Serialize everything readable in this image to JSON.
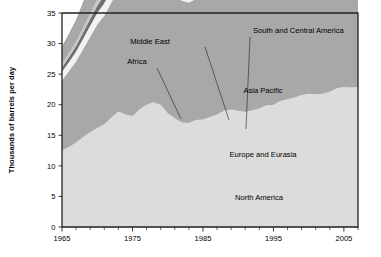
{
  "chart_data": {
    "type": "area",
    "title": "",
    "subtitle": "",
    "xlabel": "",
    "ylabel": "Thousands of barrels per day",
    "xlim": [
      1965,
      2007
    ],
    "ylim": [
      0,
      35
    ],
    "grid": true,
    "stacked": true,
    "legend_position": "inline-annotations",
    "ytick_labels": [
      "0",
      "5",
      "10",
      "15",
      "20",
      "25",
      "30",
      "35"
    ],
    "ytick_values": [
      0,
      5,
      10,
      15,
      20,
      25,
      30,
      35
    ],
    "xtick_labels": [
      "1965",
      "1975",
      "1985",
      "1995",
      "2005"
    ],
    "xtick_values": [
      1965,
      1975,
      1985,
      1995,
      2005
    ],
    "xtick_minor_step": 2,
    "x": [
      1965,
      1966,
      1967,
      1968,
      1969,
      1970,
      1971,
      1972,
      1973,
      1974,
      1975,
      1976,
      1977,
      1978,
      1979,
      1980,
      1981,
      1982,
      1983,
      1984,
      1985,
      1986,
      1987,
      1988,
      1989,
      1990,
      1991,
      1992,
      1993,
      1994,
      1995,
      1996,
      1997,
      1998,
      1999,
      2000,
      2001,
      2002,
      2003,
      2004,
      2005,
      2006,
      2007
    ],
    "series": [
      {
        "name": "North America",
        "color": "#dcdcdc",
        "label_x": 1994,
        "label_y": 4.6,
        "values": [
          12.5,
          13.1,
          13.8,
          14.7,
          15.5,
          16.2,
          16.8,
          17.9,
          18.9,
          18.4,
          18.1,
          19.2,
          20.0,
          20.4,
          20.0,
          18.6,
          17.8,
          17.1,
          17.0,
          17.5,
          17.6,
          18.0,
          18.4,
          19.0,
          19.2,
          19.0,
          18.8,
          19.1,
          19.4,
          19.9,
          20.0,
          20.6,
          20.9,
          21.2,
          21.6,
          21.8,
          21.7,
          21.8,
          22.1,
          22.7,
          22.9,
          22.8,
          22.9
        ]
      },
      {
        "name": "Europe and Eurasia",
        "color": "#a8a8a8",
        "label_x": 1994,
        "label_y": 11.8,
        "values": [
          11.5,
          12.4,
          13.3,
          14.4,
          15.6,
          16.9,
          17.8,
          18.8,
          20.0,
          19.8,
          19.4,
          20.4,
          20.8,
          21.4,
          22.1,
          21.3,
          20.3,
          19.9,
          19.7,
          19.8,
          19.9,
          20.5,
          20.7,
          21.0,
          21.0,
          20.5,
          19.6,
          19.1,
          18.4,
          18.0,
          17.9,
          18.1,
          18.1,
          18.1,
          18.2,
          18.2,
          18.4,
          18.2,
          18.3,
          18.5,
          18.6,
          18.7,
          18.6
        ]
      },
      {
        "name": "South and Central America",
        "color": "#f2f2f2",
        "label_x": 2000,
        "label_y": 31.2,
        "values": [
          1.4,
          1.5,
          1.6,
          1.7,
          1.8,
          1.9,
          2.0,
          2.1,
          2.3,
          2.4,
          2.4,
          2.6,
          2.7,
          2.8,
          2.9,
          2.9,
          2.9,
          2.9,
          2.8,
          2.8,
          2.8,
          2.9,
          3.0,
          3.1,
          3.1,
          3.2,
          3.3,
          3.4,
          3.5,
          3.6,
          3.7,
          3.9,
          4.1,
          4.3,
          4.3,
          4.4,
          4.4,
          4.3,
          4.3,
          4.5,
          4.7,
          4.8,
          5.0
        ]
      },
      {
        "name": "Middle East",
        "color": "#6f6f6f",
        "label_x": 1979,
        "label_y": 32.4,
        "values": [
          0.7,
          0.8,
          0.9,
          1.0,
          1.1,
          1.2,
          1.3,
          1.4,
          1.6,
          1.7,
          1.9,
          2.1,
          2.3,
          2.5,
          2.7,
          2.8,
          3.0,
          3.2,
          3.4,
          3.5,
          3.6,
          3.7,
          3.8,
          3.9,
          4.0,
          4.1,
          4.2,
          4.4,
          4.5,
          4.6,
          4.7,
          4.8,
          5.0,
          5.2,
          5.3,
          5.4,
          5.5,
          5.6,
          5.8,
          6.0,
          6.3,
          6.5,
          6.7
        ]
      },
      {
        "name": "Africa",
        "color": "#c6c6c6",
        "label_x": 1974,
        "label_y": 29.2,
        "values": [
          0.6,
          0.7,
          0.7,
          0.8,
          0.9,
          1.0,
          1.0,
          1.1,
          1.2,
          1.3,
          1.3,
          1.4,
          1.5,
          1.6,
          1.7,
          1.7,
          1.8,
          1.8,
          1.9,
          1.9,
          1.9,
          2.0,
          2.0,
          2.1,
          2.1,
          2.1,
          2.2,
          2.2,
          2.2,
          2.3,
          2.3,
          2.4,
          2.4,
          2.5,
          2.5,
          2.5,
          2.6,
          2.6,
          2.7,
          2.8,
          2.9,
          3.0,
          3.0
        ]
      },
      {
        "name": "Asia Pacific",
        "color": "#a8a8a8",
        "label_x": 1997,
        "label_y": 19.6,
        "values": [
          2.6,
          3.0,
          3.4,
          4.0,
          4.6,
          5.3,
          5.8,
          6.4,
          7.2,
          7.0,
          7.2,
          7.8,
          8.2,
          8.6,
          9.0,
          8.8,
          8.7,
          8.8,
          9.1,
          9.6,
          9.9,
          10.4,
          10.9,
          11.6,
          12.1,
          12.5,
          13.0,
          13.6,
          14.1,
          14.8,
          15.5,
          16.2,
          17.0,
          17.0,
          17.6,
          18.1,
          18.5,
          19.1,
          20.1,
          21.3,
          21.9,
          22.5,
          23.2
        ]
      }
    ],
    "annotations": [
      {
        "text": "Middle East",
        "text_x": 150,
        "text_y": 44,
        "anchor": "middle",
        "leader": [
          [
            205,
            47
          ],
          [
            229,
            120
          ]
        ]
      },
      {
        "text": "Africa",
        "text_x": 137,
        "text_y": 64,
        "anchor": "middle",
        "leader": [
          [
            157,
            68
          ],
          [
            181,
            119
          ]
        ]
      },
      {
        "text": "South and Central America",
        "text_x": 253,
        "text_y": 33,
        "anchor": "start",
        "leader": [
          [
            250,
            37
          ],
          [
            246,
            129
          ]
        ]
      },
      {
        "text": "Asia Pacific",
        "text_x": 263,
        "text_y": 93,
        "anchor": "middle",
        "leader": null
      },
      {
        "text": "Europe and Eurasia",
        "text_x": 263,
        "text_y": 157,
        "anchor": "middle",
        "leader": null
      },
      {
        "text": "North America",
        "text_x": 259,
        "text_y": 200,
        "anchor": "middle",
        "leader": null
      }
    ]
  },
  "axes": {
    "y_axis_title": "Thousands of barrels per day"
  }
}
